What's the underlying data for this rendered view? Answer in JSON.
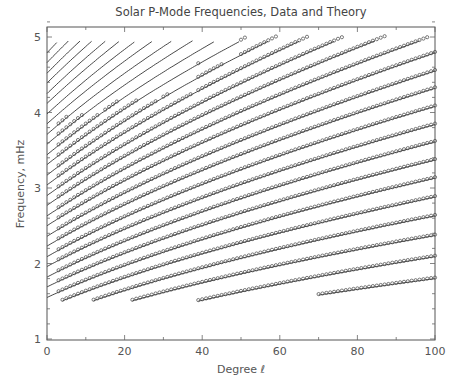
{
  "chart_data": {
    "type": "line",
    "title": "Solar P-Mode Frequencies, Data and Theory",
    "xlabel": "Degree ℓ",
    "ylabel": "Frequency, mHz",
    "xlim": [
      0,
      100
    ],
    "ylim": [
      1,
      5.2
    ],
    "x_ticks": [
      0,
      20,
      40,
      60,
      80,
      100
    ],
    "x_tick_labels": [
      "0",
      "20",
      "40",
      "60",
      "80",
      "100"
    ],
    "y_ticks": [
      1,
      2,
      3,
      4,
      5
    ],
    "y_tick_labels": [
      "1",
      "2",
      "3",
      "4",
      "5"
    ],
    "x_minor_step": 10,
    "y_minor_step": 0.2,
    "grid": false,
    "legend": null,
    "series": [
      {
        "name": "Theory",
        "style": "solid line",
        "description": "model ridges nu_n(l), one per radial order n"
      },
      {
        "name": "Data",
        "style": "open circle markers",
        "description": "observed p-mode frequencies along ridges"
      }
    ],
    "ridge_model": "nu^2 = nu0^2 + (nu100^2 - nu0^2) * l / 100",
    "ridges": [
      {
        "nu0": 0.88,
        "nu100": 1.8
      },
      {
        "nu0": 0.95,
        "nu100": 2.09
      },
      {
        "nu0": 1.15,
        "nu100": 2.37
      },
      {
        "nu0": 1.28,
        "nu100": 2.63
      },
      {
        "nu0": 1.42,
        "nu100": 2.88
      },
      {
        "nu0": 1.55,
        "nu100": 3.13
      },
      {
        "nu0": 1.69,
        "nu100": 3.37
      },
      {
        "nu0": 1.82,
        "nu100": 3.61
      },
      {
        "nu0": 1.96,
        "nu100": 3.84
      },
      {
        "nu0": 2.09,
        "nu100": 4.08
      },
      {
        "nu0": 2.23,
        "nu100": 4.32
      },
      {
        "nu0": 2.36,
        "nu100": 4.55
      },
      {
        "nu0": 2.5,
        "nu100": 4.79
      },
      {
        "nu0": 2.63,
        "nu100": 5.02
      },
      {
        "nu0": 2.77,
        "nu100": 5.25
      },
      {
        "nu0": 2.9,
        "nu100": 5.48
      },
      {
        "nu0": 3.04,
        "nu100": 5.71
      },
      {
        "nu0": 3.17,
        "nu100": 5.94
      },
      {
        "nu0": 3.31,
        "nu100": 6.17
      },
      {
        "nu0": 3.44,
        "nu100": 6.4
      },
      {
        "nu0": 3.58,
        "nu100": 6.63
      },
      {
        "nu0": 3.71,
        "nu100": 6.86
      },
      {
        "nu0": 3.85,
        "nu100": 7.09
      },
      {
        "nu0": 3.98,
        "nu100": 7.32
      },
      {
        "nu0": 4.12,
        "nu100": 7.55
      },
      {
        "nu0": 4.25,
        "nu100": 7.78
      },
      {
        "nu0": 4.39,
        "nu100": 8.01
      },
      {
        "nu0": 4.52,
        "nu100": 8.24
      },
      {
        "nu0": 4.66,
        "nu100": 8.47
      },
      {
        "nu0": 4.79,
        "nu100": 8.7
      }
    ],
    "line_frequency_range": [
      1.5,
      4.95
    ],
    "data_frequency_min": 1.5,
    "data_upper_envelope": [
      {
        "l_from": 3,
        "l_to": 15,
        "nu_max": 3.97
      },
      {
        "l_from": 15,
        "l_to": 30,
        "nu_max": 4.15
      },
      {
        "l_from": 30,
        "l_to": 39,
        "nu_max": 4.25
      },
      {
        "l_from": 39,
        "l_to": 50,
        "nu_max": 4.65
      },
      {
        "l_from": 50,
        "l_to": 100,
        "nu_max": 5.0
      }
    ],
    "data_first_ridge_start_l": 70,
    "data_second_ridge_start_l": 39,
    "line_first_ridge_start_l": 70,
    "line_second_ridge_start_l": 30
  }
}
